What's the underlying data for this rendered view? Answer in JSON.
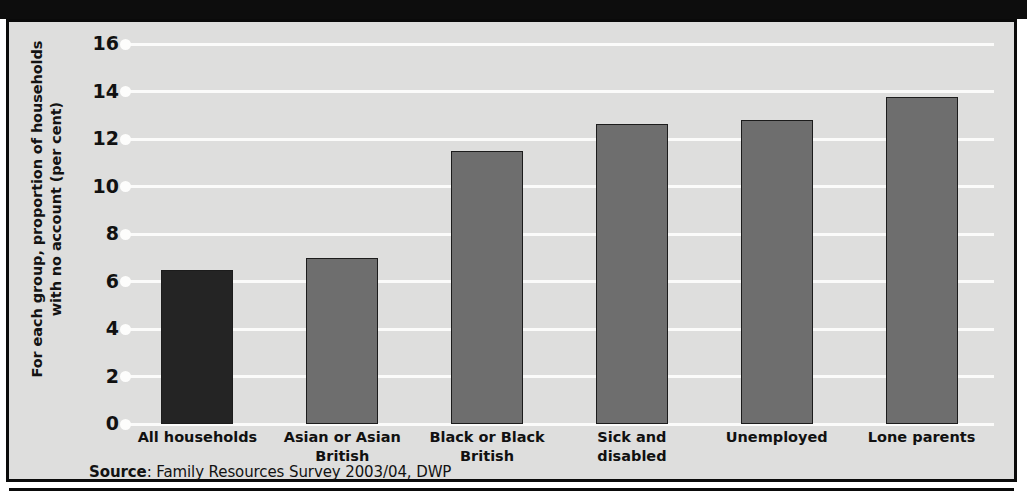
{
  "figure": {
    "y_axis_title": "For each group, proportion of households with no account (per cent)",
    "source_prefix": "Source",
    "source_text": ": Family Resources Survey 2003/04, DWP"
  },
  "colors": {
    "highlight_bar": "#242424",
    "series_bar": "#6e6e6e",
    "plot_background": "#dededd",
    "gridline": "#fbfbfa",
    "frame": "#0a0a0a"
  },
  "chart_data": {
    "type": "bar",
    "title": "",
    "xlabel": "",
    "ylabel": "For each group, proportion of households with no account (per cent)",
    "ylim": [
      0,
      16
    ],
    "yticks": [
      16,
      14,
      12,
      10,
      8,
      6,
      4,
      2,
      0
    ],
    "ytick_labels": [
      "16",
      "14",
      "12",
      "10",
      "8",
      "6",
      "4",
      "2",
      "0"
    ],
    "grid": true,
    "legend": "none",
    "categories": [
      "All households",
      "Asian or Asian British",
      "Black or Black British",
      "Sick and disabled",
      "Unemployed",
      "Lone parents"
    ],
    "category_label_lines": [
      [
        "All households"
      ],
      [
        "Asian or Asian",
        "British"
      ],
      [
        "Black or Black",
        "British"
      ],
      [
        "Sick and",
        "disabled"
      ],
      [
        "Unemployed"
      ],
      [
        "Lone parents"
      ]
    ],
    "values": [
      6.5,
      7.0,
      11.5,
      12.65,
      12.8,
      13.75
    ],
    "bar_colors": [
      "#242424",
      "#6e6e6e",
      "#6e6e6e",
      "#6e6e6e",
      "#6e6e6e",
      "#6e6e6e"
    ],
    "source": "Source: Family Resources Survey 2003/04, DWP"
  }
}
